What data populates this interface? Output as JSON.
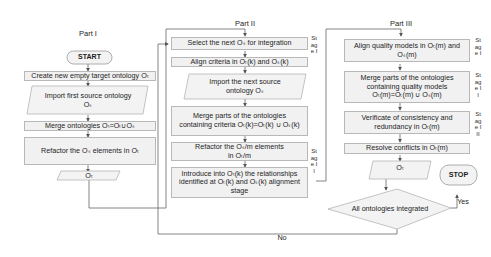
{
  "diagram": {
    "part1": {
      "title": "Part I",
      "start": "START",
      "steps": [
        "Create new empty target ontology Oₜ",
        "Import first source ontology Oₛ",
        "Merge ontologies Oₜ=Oₜ∪Oₛ",
        "Refactor  the Oₛ elements in Oₜ",
        "Oₜ"
      ]
    },
    "part2": {
      "title": "Part II",
      "stage_labels": [
        "Stage I",
        "Stage II"
      ],
      "steps": [
        "Select the next Oₛ for integration",
        "Align criteria in Oₜ(k) and Oₛ(k)",
        "Import the next source ontology Oₛ",
        "Merge parts of the ontologies containing criteria Oₜ(k)=Oₜ(k) ∪ Oₛ(k)",
        "Refactor the Oₛ/m elements in Oₜ/m",
        "Introduce into Oₜ(k) the relationships identified at Oₜ(k) and Oₛ(k) alignment stage"
      ]
    },
    "part3": {
      "title": "Part III",
      "stage_labels": [
        "Stage I",
        "Stage II",
        "Stage III"
      ],
      "steps": [
        "Align quality models in Oₜ(m) and Oₛ(m)",
        "Merge parts of the ontologies containing quality models Oₜ(m)=Oₜ(m) ∪ Oₛ(m)",
        "Verificate of consistency and redundancy in Oₜ(m)",
        "Resolve conflicts in Oₜ(m)",
        "Oₜ"
      ],
      "decision": "All ontologies integrated",
      "yes_label": "Yes",
      "no_label": "No",
      "stop": "STOP"
    }
  }
}
